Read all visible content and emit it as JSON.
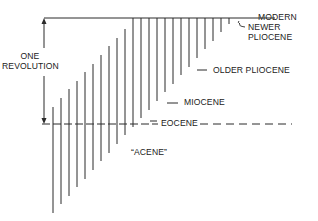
{
  "diagram": {
    "labels": {
      "one_revolution_line1": "ONE",
      "one_revolution_line2": "REVOLUTION",
      "modern": "MODERN",
      "newer_pliocene_line1": "NEWER",
      "newer_pliocene_line2": "PLIOCENE",
      "older_pliocene": "OLDER PLIOCENE",
      "miocene": "MIOCENE",
      "eocene": "EOCENE",
      "acene": "“ACENE”"
    },
    "colors": {
      "line": "#2a2a2a",
      "text": "#222222",
      "background": "#ffffff"
    },
    "geometry": {
      "top_y": 18,
      "dash_y": 124,
      "arrow_x": 44,
      "lines": [
        {
          "x": 53,
          "top": 107,
          "bottom": 213
        },
        {
          "x": 61,
          "top": 98,
          "bottom": 204
        },
        {
          "x": 69,
          "top": 89,
          "bottom": 196
        },
        {
          "x": 77,
          "top": 81,
          "bottom": 187
        },
        {
          "x": 85,
          "top": 72,
          "bottom": 179
        },
        {
          "x": 93,
          "top": 64,
          "bottom": 170
        },
        {
          "x": 101,
          "top": 55,
          "bottom": 161
        },
        {
          "x": 109,
          "top": 46,
          "bottom": 153
        },
        {
          "x": 117,
          "top": 38,
          "bottom": 144
        },
        {
          "x": 125,
          "top": 29,
          "bottom": 135
        },
        {
          "x": 133,
          "top": 18,
          "bottom": 127
        },
        {
          "x": 141,
          "top": 18,
          "bottom": 118
        },
        {
          "x": 149,
          "top": 18,
          "bottom": 110
        },
        {
          "x": 157,
          "top": 18,
          "bottom": 101
        },
        {
          "x": 165,
          "top": 18,
          "bottom": 92
        },
        {
          "x": 173,
          "top": 18,
          "bottom": 84
        },
        {
          "x": 181,
          "top": 18,
          "bottom": 75
        },
        {
          "x": 189,
          "top": 18,
          "bottom": 67
        },
        {
          "x": 197,
          "top": 18,
          "bottom": 58
        },
        {
          "x": 205,
          "top": 18,
          "bottom": 49
        },
        {
          "x": 213,
          "top": 18,
          "bottom": 41
        },
        {
          "x": 221,
          "top": 18,
          "bottom": 32
        },
        {
          "x": 229,
          "top": 18,
          "bottom": 24
        }
      ]
    }
  }
}
